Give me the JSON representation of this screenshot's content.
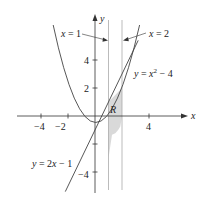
{
  "diagram": {
    "type": "function-plot",
    "axes": {
      "x_label": "x",
      "y_label": "y",
      "x_ticks": [
        "−4",
        "−2",
        "4"
      ],
      "y_ticks": [
        "2",
        "4",
        "−4"
      ]
    },
    "curves": [
      {
        "id": "parabola",
        "label": "y = x² − 4",
        "label_main": "y = x",
        "label_sup": "2",
        "label_tail": " − 4"
      },
      {
        "id": "line",
        "label": "y = 2x − 1"
      }
    ],
    "vertical_lines": [
      {
        "id": "x1",
        "label": "x = 1"
      },
      {
        "id": "x2",
        "label": "x = 2"
      }
    ],
    "region": {
      "label": "R",
      "fill": "#d9d9d9"
    },
    "colors": {
      "curve": "#444444",
      "vline": "#aaaaaa",
      "axis": "#333333"
    }
  }
}
